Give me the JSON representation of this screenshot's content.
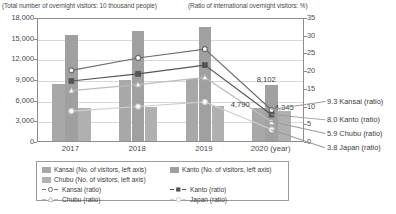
{
  "axis_captions": {
    "left": "(Total number of overnight visitors: 10 thousand people)",
    "right": "(Ratio of international overnight visitors: %)"
  },
  "footnote": "",
  "legend": {
    "bars": [
      {
        "key": "kansai",
        "label": "Kansai (No. of visitors, left axis)",
        "color": "#a8a8a8"
      },
      {
        "key": "kanto",
        "label": "Kanto (No. of visitors, left axis)",
        "color": "#a0a0a0"
      },
      {
        "key": "chubu",
        "label": "Chubu (No. of visitors, left axis)",
        "color": "#b0b0b0"
      }
    ],
    "lines": [
      {
        "key": "kansai",
        "label": "Kansai (ratio)",
        "color": "#6e6e6e",
        "marker": "circle"
      },
      {
        "key": "kanto",
        "label": "Kanto (ratio)",
        "color": "#555555",
        "marker": "square"
      },
      {
        "key": "chubu",
        "label": "Chubu (ratio)",
        "color": "#bdbdbd",
        "marker": "triangle"
      },
      {
        "key": "japan",
        "label": "Japan (ratio)",
        "color": "#cfcfcf",
        "marker": "circle"
      }
    ]
  },
  "end_labels": [
    {
      "value": "9.3",
      "name": "Kansai (ratio)",
      "text": "9.3 Kansai (ratio)"
    },
    {
      "value": "8.0",
      "name": "Kanto (ratio)",
      "text": "8.0 Kanto (ratio)"
    },
    {
      "value": "5.9",
      "name": "Chubu (ratio)",
      "text": "5.9 Chubu (ratio)"
    },
    {
      "value": "3.8",
      "name": "Japan (ratio)",
      "text": "3.8 Japan (ratio)"
    }
  ],
  "value_labels": [
    {
      "text": "8,102",
      "series": "kanto"
    },
    {
      "text": "4,790",
      "series": "kansai"
    },
    {
      "text": "4,345",
      "series": "chubu"
    }
  ],
  "chart_data": {
    "type": "bar",
    "title": "",
    "subtitle": "",
    "xlabel": "(year)",
    "ylabel": "(Total number of overnight visitors: 10 thousand people)",
    "y2label": "(Ratio of international overnight visitors: %)",
    "categories": [
      "2017",
      "2018",
      "2019",
      "2020"
    ],
    "ylim": [
      0,
      18000
    ],
    "yticks": [
      0,
      3000,
      6000,
      9000,
      12000,
      15000,
      18000
    ],
    "ytick_labels": [
      "0",
      "3,000",
      "6,000",
      "9,000",
      "12,000",
      "15,000",
      "18,000"
    ],
    "y2lim": [
      0,
      35
    ],
    "y2ticks": [
      0,
      5,
      10,
      15,
      20,
      25,
      30,
      35
    ],
    "y2tick_labels": [
      "0",
      "5",
      "10",
      "15",
      "20",
      "25",
      "30",
      "35"
    ],
    "grid": true,
    "legend_position": "bottom",
    "bar_series": [
      {
        "name": "Kansai (No. of visitors, left axis)",
        "axis": "left",
        "color": "#a8a8a8",
        "values": [
          8300,
          8800,
          9050,
          4790
        ]
      },
      {
        "name": "Kanto (No. of visitors, left axis)",
        "axis": "left",
        "color": "#a0a0a0",
        "values": [
          15400,
          15900,
          16600,
          8102
        ]
      },
      {
        "name": "Chubu (No. of visitors, left axis)",
        "axis": "left",
        "color": "#b0b0b0",
        "values": [
          4800,
          5000,
          5150,
          4345
        ]
      }
    ],
    "line_series": [
      {
        "name": "Kansai (ratio)",
        "axis": "right",
        "color": "#6e6e6e",
        "marker": "circle",
        "values": [
          20.5,
          24.0,
          26.5,
          9.3
        ],
        "end_label": "9.3"
      },
      {
        "name": "Kanto (ratio)",
        "axis": "right",
        "color": "#555555",
        "marker": "square",
        "values": [
          17.5,
          19.5,
          22.0,
          8.0
        ],
        "end_label": "8.0"
      },
      {
        "name": "Chubu (ratio)",
        "axis": "right",
        "color": "#bdbdbd",
        "marker": "triangle",
        "values": [
          14.8,
          16.5,
          18.5,
          5.9
        ],
        "end_label": "5.9"
      },
      {
        "name": "Japan (ratio)",
        "axis": "right",
        "color": "#cfcfcf",
        "marker": "circle",
        "values": [
          9.0,
          10.3,
          11.6,
          3.8
        ],
        "end_label": "3.8"
      }
    ],
    "annotations": [
      {
        "text": "8,102",
        "series": "Kanto (No. of visitors, left axis)",
        "category": "2020"
      },
      {
        "text": "4,790",
        "series": "Kansai (No. of visitors, left axis)",
        "category": "2020"
      },
      {
        "text": "4,345",
        "series": "Chubu (No. of visitors, left axis)",
        "category": "2020"
      }
    ]
  }
}
